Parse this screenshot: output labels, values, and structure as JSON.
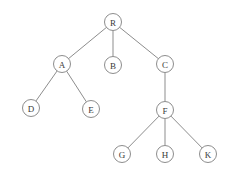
{
  "diagram": {
    "type": "tree",
    "background_color": "#ffffff",
    "node_stroke_color": "#8d8d8d",
    "node_fill_color": "#ffffff",
    "edge_color": "#8d8d8d",
    "label_color": "#3a3a3a",
    "node_radius": 8.5,
    "root": "R",
    "nodes": [
      {
        "id": "R",
        "label": "R",
        "x": 113,
        "y": 22,
        "level": 0,
        "parent": null
      },
      {
        "id": "A",
        "label": "A",
        "x": 62,
        "y": 64,
        "level": 1,
        "parent": "R"
      },
      {
        "id": "B",
        "label": "B",
        "x": 113,
        "y": 65,
        "level": 1,
        "parent": "R"
      },
      {
        "id": "C",
        "label": "C",
        "x": 165,
        "y": 64,
        "level": 1,
        "parent": "R"
      },
      {
        "id": "D",
        "label": "D",
        "x": 31,
        "y": 108,
        "level": 2,
        "parent": "A"
      },
      {
        "id": "E",
        "label": "E",
        "x": 91,
        "y": 109,
        "level": 2,
        "parent": "A"
      },
      {
        "id": "F",
        "label": "F",
        "x": 165,
        "y": 110,
        "level": 2,
        "parent": "C"
      },
      {
        "id": "G",
        "label": "G",
        "x": 122,
        "y": 154,
        "level": 3,
        "parent": "F"
      },
      {
        "id": "H",
        "label": "H",
        "x": 165,
        "y": 154,
        "level": 3,
        "parent": "F"
      },
      {
        "id": "K",
        "label": "K",
        "x": 208,
        "y": 154,
        "level": 3,
        "parent": "F"
      }
    ],
    "edges": [
      {
        "from": "R",
        "to": "A"
      },
      {
        "from": "R",
        "to": "B"
      },
      {
        "from": "R",
        "to": "C"
      },
      {
        "from": "A",
        "to": "D"
      },
      {
        "from": "A",
        "to": "E"
      },
      {
        "from": "C",
        "to": "F"
      },
      {
        "from": "F",
        "to": "G"
      },
      {
        "from": "F",
        "to": "H"
      },
      {
        "from": "F",
        "to": "K"
      }
    ]
  }
}
